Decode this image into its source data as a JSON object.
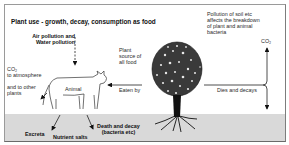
{
  "diagram": {
    "title": "Plant use - growth, decay, consumption as food",
    "labels": {
      "pollution_air_water": [
        "Air pollution and",
        "Water pollution"
      ],
      "co2_left": [
        "CO₂",
        "to atmosphere"
      ],
      "other_plants": [
        "and to other",
        "plants"
      ],
      "animal": "Animal",
      "plant_source": [
        "Plant",
        "source of",
        "all food"
      ],
      "eaten_by": "Eaten by",
      "soil_pollution": [
        "Pollution of soil etc",
        "affects the breakdown",
        "of plant and animal",
        "bacteria"
      ],
      "co2_right": "CO₂",
      "dies_decays": "Dies and decays",
      "excreta": "Excreta",
      "nutrient_salts": "Nutrient salts",
      "death_decay": [
        "Death and decay",
        "(bacteria etc)"
      ]
    },
    "nodes": [
      "animal-cow",
      "plant-tree",
      "soil-ground"
    ],
    "colors": {
      "ground": "#d9d9d9",
      "ink": "#1a1a1a",
      "border": "#9a9a9a"
    }
  }
}
